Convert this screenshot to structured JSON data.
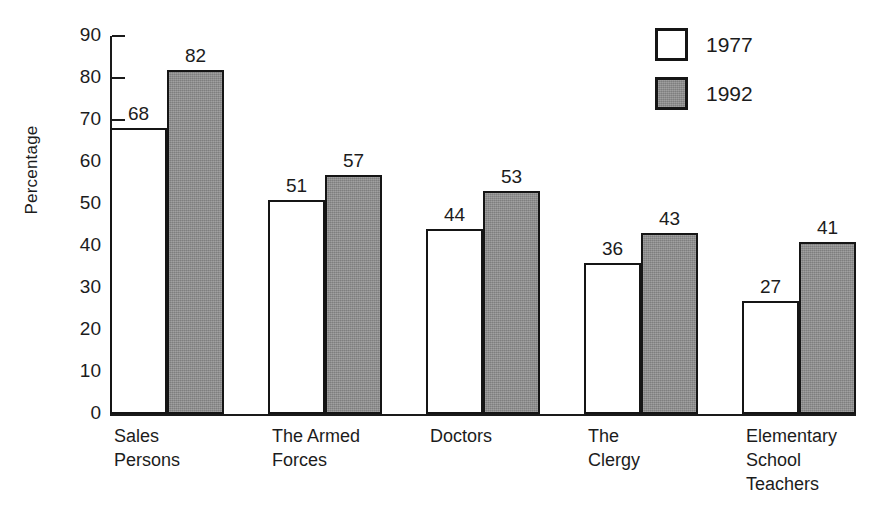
{
  "chart_data": {
    "type": "bar",
    "title": "",
    "xlabel": "",
    "ylabel": "Percentage",
    "ylim": [
      0,
      90
    ],
    "ytick_step": 10,
    "yticks": [
      0,
      10,
      20,
      30,
      40,
      50,
      60,
      70,
      80,
      90
    ],
    "grid": false,
    "legend_position": "top-right",
    "categories": [
      "Sales\nPersons",
      "The Armed\nForces",
      "Doctors",
      "The\nClergy",
      "Elementary\nSchool\nTeachers"
    ],
    "series": [
      {
        "name": "1977",
        "values": [
          68,
          51,
          44,
          36,
          27
        ],
        "color": "#ffffff",
        "edge_color": "#151515"
      },
      {
        "name": "1992",
        "values": [
          82,
          57,
          53,
          43,
          41
        ],
        "color": "#8d8d8d",
        "edge_color": "#151515"
      }
    ],
    "bar_labels": {
      "1977": [
        "68",
        "51",
        "44",
        "36",
        "27"
      ],
      "1992": [
        "82",
        "57",
        "53",
        "43",
        "41"
      ]
    }
  },
  "axis": {
    "y_title": "Percentage",
    "y_tick_labels": [
      "90",
      "80",
      "70",
      "60",
      "50",
      "40",
      "30",
      "20",
      "10",
      "0"
    ]
  },
  "legend": {
    "items": [
      {
        "label": "1977",
        "swatch": "white-square-swatch"
      },
      {
        "label": "1992",
        "swatch": "gray-square-swatch"
      }
    ]
  },
  "colors": {
    "background": "#ffffff",
    "ink": "#1a1a1a",
    "bar_1977": "#ffffff",
    "bar_1992": "#8d8d8d"
  }
}
